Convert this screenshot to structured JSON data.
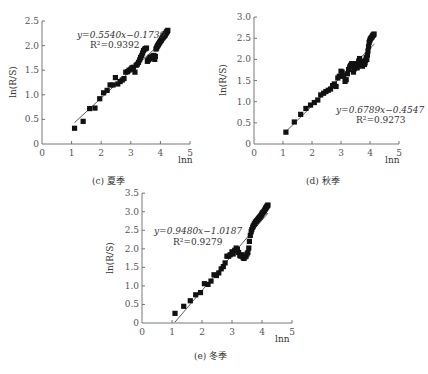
{
  "chart_data": [
    {
      "id": "c",
      "type": "scatter",
      "title": "(c) 夏季",
      "xlabel": "lnn",
      "ylabel": "ln(R/S)",
      "xlim": [
        0,
        5
      ],
      "ylim": [
        0,
        2.5
      ],
      "xticks": [
        "0",
        "1",
        "2",
        "3",
        "4",
        "5"
      ],
      "yticks": [
        "0",
        "0.5",
        "1.0",
        "1.5",
        "2.0",
        "2.5"
      ],
      "grid": false,
      "fit": {
        "equation": "y=0.5540x−0.1739",
        "r2": "R²=0.9392",
        "slope": 0.554,
        "intercept": -0.1739,
        "x_range": [
          1.1,
          4.25
        ]
      },
      "points": {
        "x": [
          1.1,
          1.39,
          1.61,
          1.79,
          1.95,
          2.08,
          2.2,
          2.3,
          2.4,
          2.48,
          2.56,
          2.64,
          2.71,
          2.77,
          2.83,
          2.89,
          2.94,
          3.0,
          3.04,
          3.09,
          3.14,
          3.18,
          3.22,
          3.26,
          3.3,
          3.33,
          3.37,
          3.4,
          3.43,
          3.47,
          3.5,
          3.53,
          3.56,
          3.58,
          3.61,
          3.64,
          3.66,
          3.69,
          3.71,
          3.74,
          3.76,
          3.78,
          3.81,
          3.83,
          3.85,
          3.87,
          3.89,
          3.91,
          3.93,
          3.95,
          3.97,
          3.99,
          4.01,
          4.03,
          4.04,
          4.06,
          4.08,
          4.09,
          4.11,
          4.13,
          4.14,
          4.16,
          4.17,
          4.19,
          4.2,
          4.22,
          4.23,
          4.25
        ],
        "y": [
          0.32,
          0.46,
          0.72,
          0.73,
          0.92,
          1.04,
          1.09,
          1.2,
          1.2,
          1.35,
          1.22,
          1.27,
          1.3,
          1.33,
          1.46,
          1.47,
          1.5,
          1.52,
          1.55,
          1.56,
          1.46,
          1.6,
          1.62,
          1.66,
          1.71,
          1.76,
          1.8,
          1.85,
          1.9,
          1.93,
          1.94,
          1.95,
          1.68,
          1.7,
          1.72,
          1.74,
          1.76,
          1.76,
          1.77,
          1.78,
          1.79,
          1.8,
          1.72,
          1.78,
          1.93,
          1.95,
          1.98,
          2.0,
          2.02,
          2.04,
          2.06,
          2.08,
          2.1,
          2.11,
          2.13,
          2.15,
          2.16,
          2.17,
          2.19,
          2.2,
          2.21,
          2.22,
          2.24,
          2.25,
          2.27,
          2.28,
          2.29,
          2.31
        ]
      }
    },
    {
      "id": "d",
      "type": "scatter",
      "title": "(d) 秋季",
      "xlabel": "lnn",
      "ylabel": "ln(R/S)",
      "xlim": [
        0,
        5
      ],
      "ylim": [
        0,
        3.0
      ],
      "xticks": [
        "0",
        "1",
        "2",
        "3",
        "4",
        "5"
      ],
      "yticks": [
        "0",
        "0.5",
        "1.0",
        "1.5",
        "2.0",
        "2.5",
        "3.0"
      ],
      "grid": false,
      "fit": {
        "equation": "y=0.6789x−0.4547",
        "r2": "R²=0.9273",
        "slope": 0.6789,
        "intercept": -0.4547,
        "x_range": [
          1.1,
          4.15
        ]
      },
      "points": {
        "x": [
          1.1,
          1.39,
          1.61,
          1.79,
          1.95,
          2.08,
          2.2,
          2.3,
          2.4,
          2.48,
          2.56,
          2.64,
          2.71,
          2.77,
          2.83,
          2.89,
          2.94,
          3.0,
          3.04,
          3.09,
          3.14,
          3.18,
          3.22,
          3.26,
          3.3,
          3.33,
          3.37,
          3.4,
          3.43,
          3.47,
          3.5,
          3.53,
          3.56,
          3.58,
          3.61,
          3.64,
          3.66,
          3.69,
          3.71,
          3.74,
          3.76,
          3.78,
          3.81,
          3.83,
          3.85,
          3.87,
          3.89,
          3.91,
          3.93,
          3.95,
          3.97,
          3.99,
          4.01,
          4.03,
          4.06,
          4.08,
          4.1,
          4.12,
          4.14
        ],
        "y": [
          0.28,
          0.52,
          0.7,
          0.84,
          0.92,
          0.98,
          1.04,
          1.16,
          1.2,
          1.24,
          1.27,
          1.3,
          1.38,
          1.42,
          1.36,
          1.56,
          1.6,
          1.72,
          1.7,
          1.6,
          1.48,
          1.52,
          1.66,
          1.76,
          1.82,
          1.86,
          1.9,
          1.88,
          1.7,
          1.78,
          1.84,
          1.9,
          1.8,
          1.86,
          1.96,
          2.02,
          1.9,
          1.94,
          1.86,
          1.84,
          1.92,
          1.96,
          1.88,
          1.92,
          1.98,
          2.04,
          2.0,
          2.1,
          2.2,
          2.3,
          2.4,
          2.44,
          2.48,
          2.5,
          2.52,
          2.55,
          2.57,
          2.58,
          2.6
        ]
      }
    },
    {
      "id": "e",
      "type": "scatter",
      "title": "(e) 冬季",
      "xlabel": "lnn",
      "ylabel": "ln(R/S)",
      "xlim": [
        0,
        5
      ],
      "ylim": [
        0,
        3.5
      ],
      "xticks": [
        "0",
        "1",
        "2",
        "3",
        "4",
        "5"
      ],
      "yticks": [
        "0",
        "0.5",
        "1.0",
        "1.5",
        "2.0",
        "2.5",
        "3.0",
        "3.5"
      ],
      "grid": false,
      "fit": {
        "equation": "y=0.9480x−1.0187",
        "r2": "R²=0.9279",
        "slope": 0.948,
        "intercept": -1.0187,
        "x_range": [
          1.1,
          4.2
        ]
      },
      "points": {
        "x": [
          1.1,
          1.39,
          1.61,
          1.79,
          1.95,
          2.08,
          2.2,
          2.3,
          2.4,
          2.48,
          2.56,
          2.64,
          2.71,
          2.77,
          2.83,
          2.89,
          2.94,
          3.0,
          3.04,
          3.09,
          3.14,
          3.18,
          3.22,
          3.26,
          3.3,
          3.33,
          3.37,
          3.4,
          3.43,
          3.47,
          3.5,
          3.53,
          3.56,
          3.58,
          3.61,
          3.64,
          3.66,
          3.69,
          3.71,
          3.74,
          3.76,
          3.78,
          3.81,
          3.83,
          3.85,
          3.87,
          3.89,
          3.91,
          3.93,
          3.95,
          3.97,
          3.99,
          4.01,
          4.03,
          4.06,
          4.08,
          4.1,
          4.12,
          4.14,
          4.16,
          4.18,
          4.2
        ],
        "y": [
          0.26,
          0.45,
          0.6,
          0.76,
          0.82,
          1.06,
          1.04,
          1.13,
          1.3,
          1.28,
          1.35,
          1.46,
          1.52,
          1.62,
          1.8,
          1.8,
          1.84,
          1.92,
          1.86,
          1.96,
          2.02,
          1.98,
          1.9,
          1.82,
          1.8,
          1.84,
          1.76,
          1.74,
          1.78,
          1.8,
          1.86,
          1.9,
          2.02,
          2.2,
          2.36,
          2.46,
          2.52,
          2.58,
          2.62,
          2.66,
          2.68,
          2.72,
          2.74,
          2.76,
          2.78,
          2.8,
          2.82,
          2.84,
          2.86,
          2.88,
          2.9,
          2.93,
          2.96,
          2.98,
          3.0,
          3.03,
          3.06,
          3.09,
          3.11,
          3.14,
          3.16,
          3.18
        ]
      }
    }
  ],
  "layout": {
    "panels": [
      {
        "id": "c",
        "x0": 42,
        "y0": 144,
        "xscale": 29.6,
        "yscale": 49.2,
        "eq_x": 77,
        "eq_y": 38,
        "r2_x": 90,
        "r2_y": 48,
        "caption_x": 92,
        "caption_y": 184,
        "xlabel_x": 178,
        "xlabel_y": 163,
        "ylabel_x": 16,
        "ylabel_y": 82,
        "label_anchor": "start"
      },
      {
        "id": "d",
        "x0": 254,
        "y0": 144,
        "xscale": 29,
        "yscale": 42.3,
        "eq_x": 336,
        "eq_y": 113,
        "r2_x": 356,
        "r2_y": 123,
        "caption_x": 306,
        "caption_y": 184,
        "xlabel_x": 385,
        "xlabel_y": 163,
        "ylabel_x": 226,
        "ylabel_y": 80,
        "label_anchor": "start"
      },
      {
        "id": "e",
        "x0": 142,
        "y0": 323,
        "xscale": 30,
        "yscale": 37.1,
        "eq_x": 154,
        "eq_y": 234,
        "r2_x": 173,
        "r2_y": 245,
        "caption_x": 194,
        "caption_y": 359,
        "xlabel_x": 275,
        "xlabel_y": 342,
        "ylabel_x": 113,
        "ylabel_y": 258,
        "label_anchor": "start"
      }
    ]
  }
}
